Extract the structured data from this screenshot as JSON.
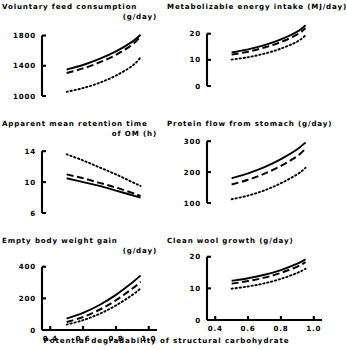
{
  "figure": {
    "shared_xlabel": "Potential  degradability  of  structural  carbohydrate",
    "x_ticks": [
      "0.4",
      "0.6",
      "0.8",
      "1.0"
    ],
    "x_tick_values": [
      0.4,
      0.6,
      0.8,
      1.0
    ],
    "xlim": [
      0.35,
      1.05
    ],
    "series_names": [
      "solid",
      "dashed",
      "dotted"
    ],
    "line_color": "#000000"
  },
  "chart_data": [
    {
      "type": "line",
      "id": "voluntary-feed-consumption",
      "title": "Voluntary feed consumption",
      "title_line2": "(g/day)",
      "xlabel": "Potential degradability of structural carbohydrate",
      "ylabel": "",
      "grid": false,
      "legend": "none",
      "xlim": [
        0.35,
        1.05
      ],
      "ylim": [
        1000,
        1900
      ],
      "yticks": [
        1000,
        1400,
        1800
      ],
      "ytick_labels": [
        "1000",
        "1400",
        "1800"
      ],
      "x": [
        0.5,
        0.6,
        0.7,
        0.8,
        0.9,
        0.95
      ],
      "series": [
        {
          "name": "solid",
          "style": "solid",
          "values": [
            1350,
            1410,
            1490,
            1590,
            1720,
            1810
          ]
        },
        {
          "name": "dashed",
          "style": "dashed",
          "values": [
            1305,
            1365,
            1445,
            1545,
            1680,
            1790
          ]
        },
        {
          "name": "dotted",
          "style": "dotted",
          "values": [
            1055,
            1105,
            1175,
            1270,
            1400,
            1510
          ]
        }
      ]
    },
    {
      "type": "line",
      "id": "metabolizable-energy-intake",
      "title": "Metabolizable energy intake (MJ/day)",
      "title_line2": "",
      "xlabel": "Potential degradability of structural carbohydrate",
      "ylabel": "",
      "grid": false,
      "legend": "none",
      "xlim": [
        0.35,
        1.05
      ],
      "ylim": [
        0,
        26
      ],
      "yticks": [
        0,
        10,
        20
      ],
      "ytick_labels": [
        "0",
        "10",
        "20"
      ],
      "x": [
        0.5,
        0.6,
        0.7,
        0.8,
        0.9,
        0.95
      ],
      "series": [
        {
          "name": "solid",
          "style": "solid",
          "values": [
            12.8,
            14.0,
            15.6,
            17.8,
            20.8,
            23.2
          ]
        },
        {
          "name": "dashed",
          "style": "dashed",
          "values": [
            12.0,
            13.1,
            14.7,
            16.8,
            19.7,
            22.1
          ]
        },
        {
          "name": "dotted",
          "style": "dotted",
          "values": [
            10.1,
            11.0,
            12.4,
            14.3,
            17.0,
            19.4
          ]
        }
      ]
    },
    {
      "type": "line",
      "id": "apparent-mean-retention-time-om",
      "title": "Apparent mean retention time",
      "title_line2": "of OM  (h)",
      "xlabel": "Potential degradability of structural carbohydrate",
      "ylabel": "",
      "grid": false,
      "legend": "none",
      "xlim": [
        0.35,
        1.05
      ],
      "ylim": [
        6,
        14.8
      ],
      "yticks": [
        6,
        10,
        14
      ],
      "ytick_labels": [
        "6",
        "10",
        "14"
      ],
      "x": [
        0.5,
        0.6,
        0.7,
        0.8,
        0.9,
        0.95
      ],
      "series": [
        {
          "name": "dotted",
          "style": "dotted",
          "values": [
            13.6,
            12.8,
            11.9,
            11.0,
            10.0,
            9.5
          ]
        },
        {
          "name": "dashed",
          "style": "dashed",
          "values": [
            11.0,
            10.5,
            9.9,
            9.3,
            8.6,
            8.2
          ]
        },
        {
          "name": "solid",
          "style": "solid",
          "values": [
            10.5,
            10.0,
            9.5,
            8.9,
            8.3,
            8.0
          ]
        }
      ]
    },
    {
      "type": "line",
      "id": "protein-flow-from-stomach",
      "title": "Protein flow from stomach (g/day)",
      "title_line2": "",
      "xlabel": "Potential degradability of structural carbohydrate",
      "ylabel": "",
      "grid": false,
      "legend": "none",
      "xlim": [
        0.35,
        1.05
      ],
      "ylim": [
        100,
        320
      ],
      "yticks": [
        100,
        200,
        300
      ],
      "ytick_labels": [
        "100",
        "200",
        "300"
      ],
      "x": [
        0.5,
        0.6,
        0.7,
        0.8,
        0.9,
        0.95
      ],
      "series": [
        {
          "name": "solid",
          "style": "solid",
          "values": [
            180,
            196,
            216,
            242,
            274,
            296
          ]
        },
        {
          "name": "dashed",
          "style": "dashed",
          "values": [
            160,
            175,
            195,
            220,
            252,
            276
          ]
        },
        {
          "name": "dotted",
          "style": "dotted",
          "values": [
            112,
            124,
            141,
            164,
            193,
            214
          ]
        }
      ]
    },
    {
      "type": "line",
      "id": "empty-body-weight-gain",
      "title": "Empty body weight gain",
      "title_line2": "(g/day)",
      "xlabel": "Potential degradability of structural carbohydrate",
      "ylabel": "",
      "grid": false,
      "legend": "none",
      "xlim": [
        0.35,
        1.05
      ],
      "ylim": [
        0,
        430
      ],
      "yticks": [
        0,
        200,
        400
      ],
      "ytick_labels": [
        "0",
        "200",
        "400"
      ],
      "x": [
        0.5,
        0.6,
        0.7,
        0.8,
        0.9,
        0.95
      ],
      "series": [
        {
          "name": "solid",
          "style": "solid",
          "values": [
            72,
            108,
            158,
            222,
            300,
            345
          ]
        },
        {
          "name": "dashed",
          "style": "dashed",
          "values": [
            50,
            82,
            128,
            188,
            262,
            305
          ]
        },
        {
          "name": "dotted",
          "style": "dotted",
          "values": [
            34,
            62,
            102,
            155,
            222,
            262
          ]
        }
      ]
    },
    {
      "type": "line",
      "id": "clean-wool-growth",
      "title": "Clean wool growth (g/day)",
      "title_line2": "",
      "xlabel": "Potential degradability of structural carbohydrate",
      "ylabel": "",
      "grid": false,
      "legend": "none",
      "xlim": [
        0.35,
        1.05
      ],
      "ylim": [
        0,
        21.5
      ],
      "yticks": [
        0,
        10,
        20
      ],
      "ytick_labels": [
        "0",
        "10",
        "20"
      ],
      "x": [
        0.5,
        0.6,
        0.7,
        0.8,
        0.9,
        0.95
      ],
      "series": [
        {
          "name": "solid",
          "style": "solid",
          "values": [
            12.4,
            13.2,
            14.3,
            15.8,
            17.8,
            19.2
          ]
        },
        {
          "name": "dashed",
          "style": "dashed",
          "values": [
            11.5,
            12.3,
            13.4,
            14.9,
            16.9,
            18.3
          ]
        },
        {
          "name": "dotted",
          "style": "dotted",
          "values": [
            9.9,
            10.6,
            11.6,
            13.0,
            14.9,
            16.2
          ]
        }
      ]
    }
  ]
}
